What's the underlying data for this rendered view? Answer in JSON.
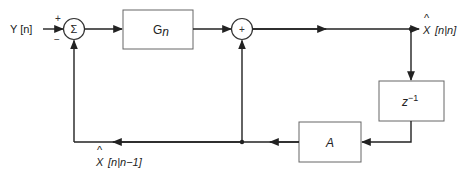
{
  "diagram": {
    "type": "block-diagram",
    "input": {
      "label": "Y [n]"
    },
    "summing_junction": {
      "symbol": "Σ",
      "plus_sign": "+",
      "minus_sign": "−"
    },
    "gain_block": {
      "label_main": "G",
      "label_sub": "n"
    },
    "adder": {
      "symbol": "+"
    },
    "output": {
      "hat": "^",
      "label_var": "X",
      "label_idx": "[n|n]"
    },
    "delay_block": {
      "label_main": "z",
      "label_sup": "−1"
    },
    "transition_block": {
      "label": "A"
    },
    "feedback": {
      "hat": "^",
      "label_var": "X",
      "label_idx": "[n|n−1]"
    },
    "colors": {
      "line": "#222222",
      "box_border": "#555555",
      "background": "#ffffff"
    }
  }
}
